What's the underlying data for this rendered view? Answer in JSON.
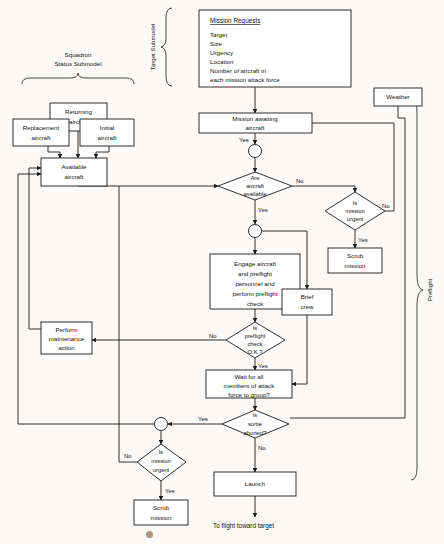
{
  "diagram": {
    "canvas": {
      "width": 444,
      "height": 544
    },
    "colors": {
      "line": "#1a1a1a",
      "box_fill": "#ffffff",
      "page": "#fbfaf8",
      "text": "#111111"
    }
  },
  "group_labels": {
    "target_submodel": "Target Submodel",
    "squadron_line1": "Squadron",
    "squadron_line2": "Status Submodel",
    "preflight": "Preflight"
  },
  "mission_requests": {
    "title": "Mission Requests",
    "items": [
      "Target",
      "Size",
      "Urgency",
      "Location",
      "Number of aircraft in",
      "each mission attack force"
    ]
  },
  "nodes": {
    "returning_aircraft": {
      "line1": "Returning",
      "line2": "aircraft"
    },
    "replacement_aircraft": {
      "line1": "Replacement",
      "line2": "aircraft"
    },
    "initial_aircraft": {
      "line1": "Initial",
      "line2": "aircraft"
    },
    "available_aircraft": {
      "line1": "Available",
      "line2": "aircraft"
    },
    "weather": {
      "line1": "Weather"
    },
    "mission_awaiting": {
      "line1": "Mission awaiting",
      "line2": "aircraft"
    },
    "are_aircraft_available": {
      "line1": "Are",
      "line2": "aircraft",
      "line3": "available"
    },
    "is_mission_urgent_top": {
      "line1": "Is",
      "line2": "mission",
      "line3": "urgent"
    },
    "scrub_mission_top": {
      "line1": "Scrub",
      "line2": "mission"
    },
    "engage_aircraft": {
      "line1": "Engage aircraft",
      "line2": "and preflight",
      "line3": "personnel and",
      "line4": "perform preflight",
      "line5": "check"
    },
    "brief_crew": {
      "line1": "Brief",
      "line2": "crew"
    },
    "is_preflight_ok": {
      "line1": "Is",
      "line2": "preflight",
      "line3": "check",
      "line4": "O.K.?"
    },
    "perform_maintenance": {
      "line1": "Perform",
      "line2": "maintenance",
      "line3": "action"
    },
    "wait_for_members": {
      "line1": "Wait for all",
      "line2": "members of attack",
      "line3": "force to group?"
    },
    "is_sortie_aborted": {
      "line1": "Is",
      "line2": "sortie",
      "line3": "aborted?"
    },
    "is_mission_urgent_bottom": {
      "line1": "Is",
      "line2": "mission",
      "line3": "urgent"
    },
    "scrub_mission_bottom": {
      "line1": "Scrub",
      "line2": "mission"
    },
    "launch": {
      "line1": "Launch"
    }
  },
  "edge_labels": {
    "mission_awaiting_yes": "Yes",
    "aircraft_available_no": "No",
    "aircraft_available_yes": "Yes",
    "urgent_top_no": "No",
    "urgent_top_yes": "Yes",
    "preflight_no": "No",
    "preflight_yes": "Yes",
    "sortie_yes": "Yes",
    "sortie_no": "No",
    "urgent_bottom_no": "No",
    "urgent_bottom_yes": "Yes"
  },
  "outputs": {
    "to_flight": "To flight toward target"
  }
}
